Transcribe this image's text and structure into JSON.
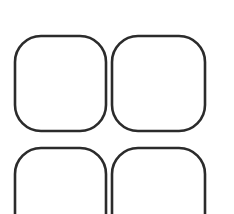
{
  "canvas": {
    "width": 234,
    "height": 214,
    "background_color": "#ffffff",
    "description": "Four rounded-square outlines arranged in a two-by-two grid; bottom row cropped by image edge"
  },
  "style": {
    "stroke_color": "#2b2b2b",
    "stroke_width": 2.6,
    "fill": "none",
    "corner_radius": 26
  },
  "grid": {
    "columns": 2,
    "rows": 2,
    "column_gap": 5,
    "row_gap": 17,
    "shape_count": 4
  },
  "shapes": [
    {
      "name": "rounded-square-top-left",
      "x": 15,
      "y": 36,
      "width": 91,
      "height": 95,
      "radius": 26,
      "cropped": false
    },
    {
      "name": "rounded-square-top-right",
      "x": 112,
      "y": 36,
      "width": 93,
      "height": 95,
      "radius": 26,
      "cropped": false
    },
    {
      "name": "rounded-square-bottom-left",
      "x": 15,
      "y": 148,
      "width": 91,
      "height": 95,
      "radius": 26,
      "cropped": true
    },
    {
      "name": "rounded-square-bottom-right",
      "x": 112,
      "y": 148,
      "width": 93,
      "height": 95,
      "radius": 26,
      "cropped": true
    }
  ]
}
